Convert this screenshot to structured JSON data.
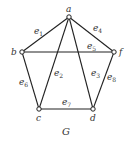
{
  "graph": {
    "name": "G",
    "vertices": [
      {
        "id": "a",
        "label": "a",
        "x": 69,
        "y": 17,
        "lx": 66,
        "ly": 12
      },
      {
        "id": "b",
        "label": "b",
        "x": 22,
        "y": 52,
        "lx": 11,
        "ly": 55
      },
      {
        "id": "f",
        "label": "f",
        "x": 114,
        "y": 52,
        "lx": 119,
        "ly": 55
      },
      {
        "id": "c",
        "label": "c",
        "x": 39,
        "y": 109,
        "lx": 36,
        "ly": 121
      },
      {
        "id": "d",
        "label": "d",
        "x": 93,
        "y": 109,
        "lx": 90,
        "ly": 121
      }
    ],
    "edges": [
      {
        "id": "e1",
        "name": "e",
        "sub": "1",
        "from": "a",
        "to": "b",
        "lx": 34,
        "ly": 34
      },
      {
        "id": "e2",
        "name": "e",
        "sub": "2",
        "from": "a",
        "to": "c",
        "lx": 54,
        "ly": 76
      },
      {
        "id": "e3",
        "name": "e",
        "sub": "3",
        "from": "a",
        "to": "d",
        "lx": 91,
        "ly": 76
      },
      {
        "id": "e4",
        "name": "e",
        "sub": "4",
        "from": "a",
        "to": "f",
        "lx": 93,
        "ly": 31
      },
      {
        "id": "e5",
        "name": "e",
        "sub": "5",
        "from": "b",
        "to": "f",
        "lx": 87,
        "ly": 49
      },
      {
        "id": "e6",
        "name": "e",
        "sub": "6",
        "from": "b",
        "to": "c",
        "lx": 19,
        "ly": 85
      },
      {
        "id": "e7",
        "name": "e",
        "sub": "7",
        "from": "c",
        "to": "d",
        "lx": 62,
        "ly": 105
      },
      {
        "id": "e8",
        "name": "e",
        "sub": "8",
        "from": "f",
        "to": "d",
        "lx": 107,
        "ly": 80
      }
    ],
    "caption": {
      "text": "G",
      "x": 62,
      "y": 135
    }
  }
}
